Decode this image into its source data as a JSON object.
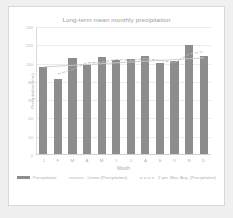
{
  "chart_data": {
    "type": "bar",
    "title": "Long-term mean monthly precipitation",
    "xlabel": "Month",
    "ylabel": "Precipitation (mm)",
    "categories": [
      "J",
      "F",
      "M",
      "A",
      "M",
      "J",
      "J",
      "A",
      "S",
      "O",
      "N",
      "D"
    ],
    "values": [
      95,
      82,
      105,
      97,
      106,
      103,
      104,
      107,
      100,
      102,
      119,
      107
    ],
    "ylim": [
      0,
      140
    ],
    "yticks": [
      0,
      20,
      40,
      60,
      80,
      100,
      120,
      140
    ],
    "ytick_labels": [
      "0",
      "20",
      "40",
      "60",
      "80",
      "100",
      "120",
      "140"
    ],
    "grid": true,
    "legend_position": "bottom",
    "series": [
      {
        "name": "Precipitation",
        "kind": "bar",
        "color": "#8d8d8d",
        "values": [
          95,
          82,
          105,
          97,
          106,
          103,
          104,
          107,
          100,
          102,
          119,
          107
        ]
      },
      {
        "name": "Linear (Precipitation)",
        "kind": "line",
        "style": "solid",
        "color": "#c9c9c9",
        "values": [
          96.3,
          97.2,
          98.1,
          99.0,
          99.9,
          100.8,
          101.7,
          102.6,
          103.5,
          104.4,
          105.3,
          106.2
        ]
      },
      {
        "name": "2 per. Mov. Avg. (Precipitation)",
        "kind": "line",
        "style": "dashed",
        "color": "#bdbdbd",
        "values": [
          null,
          88.5,
          93.5,
          101.0,
          101.5,
          104.5,
          103.5,
          105.5,
          103.5,
          101.0,
          110.5,
          113.0
        ]
      }
    ]
  },
  "legend": {
    "items": [
      {
        "label": "Precipitation",
        "marker": "bar-swatch"
      },
      {
        "label": "Linear (Precipitation)",
        "marker": "solid-line"
      },
      {
        "label": "2 per. Mov. Avg. (Precipitation)",
        "marker": "dashed-line"
      }
    ]
  }
}
